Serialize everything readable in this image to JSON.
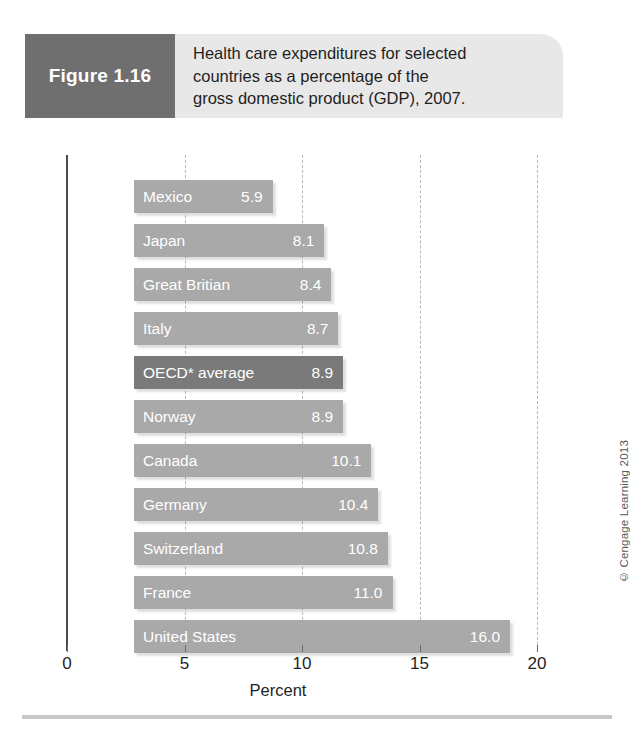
{
  "figure": {
    "number_label": "Figure 1.16",
    "caption_lines": [
      "Health care expenditures for selected",
      "countries as a percentage of the",
      "gross domestic product (GDP), 2007."
    ]
  },
  "credit": "© Cengage Learning 2013",
  "colors": {
    "figure_number_box": "#6f6f6f",
    "header_band": "#e8e8e8",
    "bar": "#a9a9a9",
    "bar_highlight": "#7a7a7a",
    "axis": "#4a4a4a",
    "gridline": "#b9b9b9"
  },
  "chart_data": {
    "type": "bar",
    "orientation": "horizontal",
    "title": "Health care expenditures for selected countries as a percentage of the gross domestic product (GDP), 2007.",
    "xlabel": "Percent",
    "ylabel": "",
    "xlim": [
      0,
      20
    ],
    "xticks": [
      0,
      5,
      10,
      15,
      20
    ],
    "xtick_labels": [
      "0",
      "5",
      "10",
      "15",
      "20"
    ],
    "grid": "vertical-dashed",
    "legend": "none",
    "categories": [
      "Mexico",
      "Japan",
      "Great Britian",
      "Italy",
      "OECD* average",
      "Norway",
      "Canada",
      "Germany",
      "Switzerland",
      "France",
      "United States"
    ],
    "values": [
      5.9,
      8.1,
      8.4,
      8.7,
      8.9,
      8.9,
      10.1,
      10.4,
      10.8,
      11.0,
      16.0
    ],
    "value_labels": [
      "5.9",
      "8.1",
      "8.4",
      "8.7",
      "8.9",
      "8.9",
      "10.1",
      "10.4",
      "10.8",
      "11.0",
      "16.0"
    ],
    "highlighted": [
      "OECD* average"
    ],
    "bars": [
      {
        "category": "Mexico",
        "value": 5.9,
        "label": "5.9",
        "highlight": false
      },
      {
        "category": "Japan",
        "value": 8.1,
        "label": "8.1",
        "highlight": false
      },
      {
        "category": "Great Britian",
        "value": 8.4,
        "label": "8.4",
        "highlight": false
      },
      {
        "category": "Italy",
        "value": 8.7,
        "label": "8.7",
        "highlight": false
      },
      {
        "category": "OECD* average",
        "value": 8.9,
        "label": "8.9",
        "highlight": true
      },
      {
        "category": "Norway",
        "value": 8.9,
        "label": "8.9",
        "highlight": false
      },
      {
        "category": "Canada",
        "value": 10.1,
        "label": "10.1",
        "highlight": false
      },
      {
        "category": "Germany",
        "value": 10.4,
        "label": "10.4",
        "highlight": false
      },
      {
        "category": "Switzerland",
        "value": 10.8,
        "label": "10.8",
        "highlight": false
      },
      {
        "category": "France",
        "value": 11.0,
        "label": "11.0",
        "highlight": false
      },
      {
        "category": "United States",
        "value": 16.0,
        "label": "16.0",
        "highlight": false
      }
    ]
  }
}
